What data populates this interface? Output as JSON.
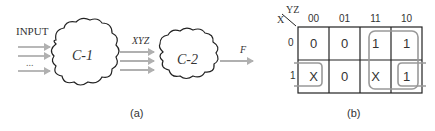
{
  "panel_a": {
    "input_label": "INPUT",
    "input_ellipsis": "...",
    "block1_label": "C-1",
    "block2_label": "C-2",
    "intermediate_label": "XYZ",
    "output_label": "F",
    "caption": "(a)"
  },
  "panel_b": {
    "corner_row_var": "X",
    "corner_col_var": "YZ",
    "col_headers": [
      "00",
      "01",
      "11",
      "10"
    ],
    "row_headers": [
      "0",
      "1"
    ],
    "cells": [
      [
        "0",
        "0",
        "1",
        "1"
      ],
      [
        "X",
        "0",
        "X",
        "1"
      ]
    ],
    "groupings": [
      {
        "covers": "X=0,1 ; YZ=11,10",
        "description": "quad of columns 11 and 10"
      },
      {
        "covers": "X=1 ; YZ=00 and YZ=10",
        "description": "wrap-around pair on row 1 (00 and 10)"
      }
    ],
    "caption": "(b)"
  },
  "colors": {
    "arrow": "#b0b0b0",
    "group_outline": "#999999",
    "grid": "#222222",
    "text": "#333333"
  }
}
